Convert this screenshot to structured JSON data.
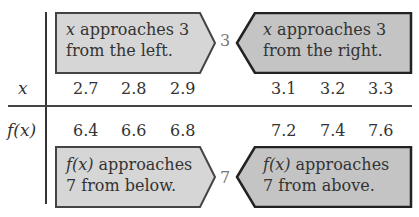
{
  "table": {
    "x_label": "x",
    "fx_label": "f(x)",
    "x_values_left": [
      "2.7",
      "2.8",
      "2.9"
    ],
    "x_values_right": [
      "3.1",
      "3.2",
      "3.3"
    ],
    "fx_values_left": [
      "6.4",
      "6.6",
      "6.8"
    ],
    "fx_values_right": [
      "7.2",
      "7.4",
      "7.6"
    ],
    "x_center": "3",
    "fx_center": "7"
  },
  "callouts": {
    "x_left": {
      "var": "x",
      "line1_rest": " approaches 3",
      "line2": "from the left."
    },
    "x_right": {
      "var": "x",
      "line1_rest": " approaches 3",
      "line2": "from the right."
    },
    "fx_below": {
      "var": "f(x)",
      "line1_rest": " approaches",
      "line2": "7 from below."
    },
    "fx_above": {
      "var": "f(x)",
      "line1_rest": " approaches",
      "line2": "7 from above."
    }
  },
  "colors": {
    "light_fill": "#d6d6d6",
    "dark_fill": "#c4c4c4",
    "outline": "#333333"
  }
}
